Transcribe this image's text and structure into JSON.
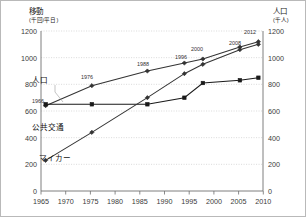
{
  "chart_data": {
    "type": "line",
    "title": "",
    "ylabel": "移動",
    "ylabel_unit": "(千回/平日)",
    "y2label": "人口",
    "y2label_unit": "(千人)",
    "xlabel": "",
    "xlim": [
      1965,
      2013
    ],
    "ylim": [
      0,
      1200
    ],
    "y2lim": [
      0,
      1200
    ],
    "yticks": [
      0,
      200,
      400,
      600,
      800,
      1000,
      1200
    ],
    "y2ticks": [
      0,
      200,
      400,
      600,
      800,
      1000,
      1200
    ],
    "xticks": [
      1965,
      1970,
      1975,
      1980,
      1985,
      1990,
      1995,
      2000,
      2005,
      2010
    ],
    "grid": true,
    "legend_position": "inline-labels",
    "series": [
      {
        "name": "人口",
        "axis": "right",
        "color": "#333333",
        "marker": "diamond",
        "x": [
          1966,
          1976,
          1988,
          1996,
          2000,
          2008,
          2012
        ],
        "values": [
          640,
          790,
          900,
          960,
          990,
          1080,
          1120
        ]
      },
      {
        "name": "公共交通",
        "axis": "left",
        "color": "#1a1a1a",
        "marker": "square",
        "x": [
          1966,
          1976,
          1988,
          1996,
          2000,
          2008,
          2012
        ],
        "values": [
          650,
          650,
          650,
          700,
          810,
          830,
          850
        ]
      },
      {
        "name": "マイカー",
        "axis": "left",
        "color": "#333333",
        "marker": "diamond",
        "x": [
          1966,
          1976,
          1988,
          1996,
          2000,
          2008,
          2012
        ],
        "values": [
          230,
          440,
          700,
          880,
          950,
          1060,
          1100
        ]
      }
    ],
    "annotations": [
      {
        "text": "1966",
        "series": "人口",
        "year": 1966
      },
      {
        "text": "1976",
        "series": "人口",
        "year": 1976
      },
      {
        "text": "1988",
        "series": "人口",
        "year": 1988
      },
      {
        "text": "1996",
        "series": "人口",
        "year": 1996
      },
      {
        "text": "2000",
        "series": "人口",
        "year": 2000
      },
      {
        "text": "2008",
        "series": "人口",
        "year": 2008
      },
      {
        "text": "2012",
        "series": "人口",
        "year": 2012
      }
    ]
  },
  "labels": {
    "y_axis_title": "移動",
    "y_axis_unit": "(千回/平日)",
    "y2_axis_title": "人口",
    "y2_axis_unit": "(千人)",
    "series_population": "人口",
    "series_transit": "公共交通",
    "series_car": "マイカー",
    "ann_1966": "1966",
    "ann_1976": "1976",
    "ann_1988": "1988",
    "ann_1996": "1996",
    "ann_2000": "2000",
    "ann_2008": "2008",
    "ann_2012": "2012",
    "yt_0": "0",
    "yt_200": "200",
    "yt_400": "400",
    "yt_600": "600",
    "yt_800": "800",
    "yt_1000": "1000",
    "yt_1200": "1200",
    "y2t_0": "0",
    "y2t_200": "200",
    "y2t_400": "400",
    "y2t_600": "600",
    "y2t_800": "800",
    "y2t_1000": "1000",
    "y2t_1200": "1200",
    "xt_1965": "1965",
    "xt_1970": "1970",
    "xt_1975": "1975",
    "xt_1980": "1980",
    "xt_1985": "1985",
    "xt_1990": "1990",
    "xt_1995": "1995",
    "xt_2000": "2000",
    "xt_2005": "2005",
    "xt_2010": "2010"
  }
}
